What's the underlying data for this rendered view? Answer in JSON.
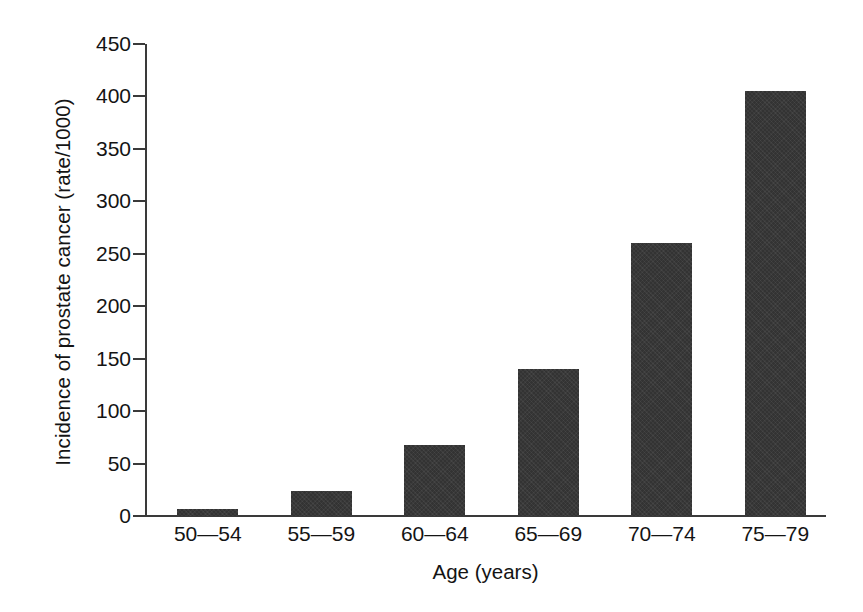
{
  "chart_data": {
    "type": "bar",
    "title": "",
    "subtitle": "",
    "xlabel": "Age (years)",
    "ylabel": "Incidence of prostate cancer (rate/1000)",
    "categories": [
      "50—54",
      "55—59",
      "60—64",
      "65—69",
      "70—74",
      "75—79"
    ],
    "values": [
      7,
      24,
      68,
      140,
      260,
      405
    ],
    "ylim": [
      0,
      450
    ],
    "yticks": [
      0,
      50,
      100,
      150,
      200,
      250,
      300,
      350,
      400,
      450
    ],
    "ytick_labels": [
      "0",
      "50",
      "100",
      "150",
      "200",
      "250",
      "300",
      "350",
      "400",
      "450"
    ],
    "grid": false,
    "legend": false,
    "legend_position": "none",
    "bar_color": "#333333",
    "axis_color": "#3a3a3a",
    "background_color": "#ffffff",
    "series": [
      {
        "name": "Incidence of prostate cancer (rate/1000)",
        "values": [
          7,
          24,
          68,
          140,
          260,
          405
        ]
      }
    ]
  }
}
